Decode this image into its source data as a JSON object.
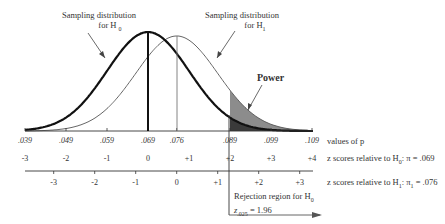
{
  "annotations": {
    "h0_label_line1": "Sampling distribution",
    "h0_label_line2": "for H",
    "h0_sub": "0",
    "h1_label_line1": "Sampling distribution",
    "h1_label_line2": "for H",
    "h1_sub": "1",
    "power": "Power",
    "rejection_line1": "Rejection region for H",
    "rejection_sub": "0",
    "critical_z": "z",
    "critical_z_sub": ".025",
    "critical_z_value": " = 1.96"
  },
  "axes": {
    "p_axis_label": "values of p",
    "z0_axis_label": "z scores relative to H",
    "z0_axis_sub": "0",
    "z0_axis_suffix": ": π = .069",
    "z1_axis_label": "z scores relative to H",
    "z1_axis_sub": "1",
    "z1_axis_suffix": ": π",
    "z1_axis_pi_sub": "1",
    "z1_axis_value": " = .076"
  },
  "chart_data": {
    "type": "area",
    "xlabel": "values of p",
    "p_ticks": [
      ".039",
      ".049",
      ".059",
      ".069",
      ".076",
      ".089",
      ".099",
      ".109"
    ],
    "z_ticks_H0": [
      "-3",
      "-2",
      "-1",
      "0",
      "+1",
      "+2",
      "+3",
      "+4"
    ],
    "z_ticks_H1": [
      "-3",
      "-2",
      "-1",
      "0",
      "+1",
      "+2",
      "+3"
    ],
    "series": [
      {
        "name": "Sampling distribution for H0",
        "mean": 0.069,
        "sd": 0.01,
        "style": "thick"
      },
      {
        "name": "Sampling distribution for H1",
        "mean": 0.076,
        "sd": 0.01,
        "style": "thin"
      }
    ],
    "critical_value_p": 0.089,
    "critical_z": 1.96,
    "alpha_one_tail": 0.025,
    "shaded_regions": [
      "Power (area under H1 beyond .089)",
      "Rejection region for H0 (area under H0 beyond .089)"
    ]
  }
}
